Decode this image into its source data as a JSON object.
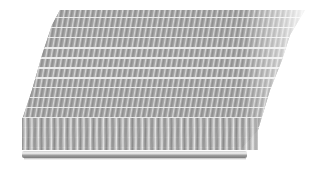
{
  "image": {
    "subject": "metal wire mesh conveyor belt",
    "description": "Perspective photo of a spiral-weave stainless steel wire mesh belt with a connecting rod along the front edge",
    "colors": {
      "background": "#ffffff",
      "metal_dark": "#8e8e8e",
      "metal_mid": "#a9a9a9",
      "metal_light": "#e6e6e6",
      "rod": "#cfcfcf"
    }
  }
}
